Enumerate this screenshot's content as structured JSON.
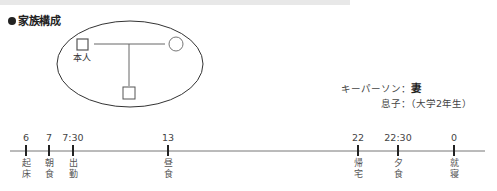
{
  "header": {
    "title": "家族構成"
  },
  "family": {
    "self_label": "本人",
    "members": [
      {
        "role": "self",
        "shape": "square"
      },
      {
        "role": "spouse",
        "shape": "circle"
      },
      {
        "role": "son",
        "shape": "square"
      }
    ]
  },
  "notes": {
    "keyperson_label": "キーパーソン：",
    "keyperson_value": "妻",
    "son_label": "息子：（大学2年生）"
  },
  "timeline": {
    "ticks": [
      {
        "time": "6",
        "event": "起床",
        "x": 26
      },
      {
        "time": "7",
        "event": "朝食",
        "x": 49
      },
      {
        "time": "7:30",
        "event": "出勤",
        "x": 73
      },
      {
        "time": "13",
        "event": "昼食",
        "x": 168
      },
      {
        "time": "22",
        "event": "帰宅",
        "x": 358
      },
      {
        "time": "22:30",
        "event": "夕食",
        "x": 398
      },
      {
        "time": "0",
        "event": "就寝",
        "x": 454
      }
    ]
  }
}
